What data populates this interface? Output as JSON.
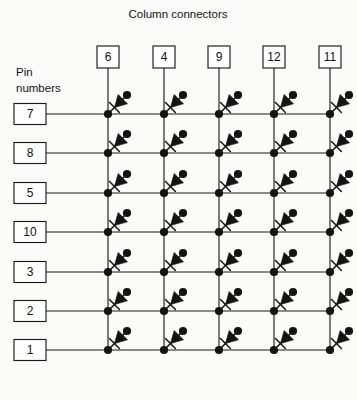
{
  "diagram": {
    "title": "Column connectors",
    "row_group_label_line1": "Pin",
    "row_group_label_line2": "numbers",
    "columns": [
      {
        "label": "6",
        "x": 108
      },
      {
        "label": "4",
        "x": 164
      },
      {
        "label": "9",
        "x": 219
      },
      {
        "label": "12",
        "x": 274
      },
      {
        "label": "11",
        "x": 330
      }
    ],
    "rows": [
      {
        "label": "7",
        "y": 114
      },
      {
        "label": "8",
        "y": 153
      },
      {
        "label": "5",
        "y": 193
      },
      {
        "label": "10",
        "y": 232
      },
      {
        "label": "3",
        "y": 272
      },
      {
        "label": "2",
        "y": 311
      },
      {
        "label": "1",
        "y": 350
      }
    ],
    "component": "diode",
    "component_count": 35,
    "colors": {
      "background": "#fbfbfa",
      "ink": "#141414",
      "wire": "#1c1c1c",
      "box_fill": "#ffffff"
    },
    "geometry": {
      "column_box_y": 46,
      "column_box_w": 22,
      "column_box_h": 22,
      "row_box_x": 14,
      "row_box_w": 32,
      "row_box_h": 21,
      "row_line_left": 46,
      "row_line_right": 330,
      "column_line_top": 68,
      "column_line_bottom": 350,
      "dot_radius": 4.1,
      "title_x": 178,
      "title_y": 18,
      "pin_label_x": 16,
      "pin_label_y1": 76,
      "pin_label_y2": 92
    }
  }
}
